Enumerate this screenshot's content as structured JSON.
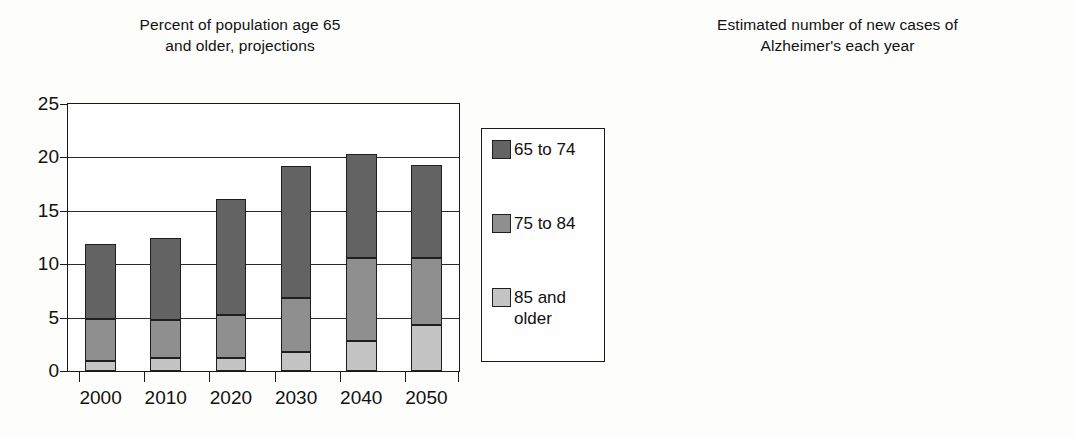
{
  "figure": {
    "background": "#fdfdfb",
    "axis_color": "#1a1a1a"
  },
  "legend": {
    "name": "age-group-legend",
    "position": "center",
    "entries": [
      {
        "label": "65 to 74",
        "color": "#636363"
      },
      {
        "label": "75 to 84",
        "color": "#8f8f8f"
      },
      {
        "label": "85 and\nolder",
        "color": "#c4c4c4"
      }
    ]
  },
  "chart_data": [
    {
      "id": "population-65-plus",
      "type": "bar",
      "stacked": true,
      "title": "Percent of population age 65\nand older, projections",
      "xlabel": "",
      "ylabel": "",
      "categories": [
        "2000",
        "2010",
        "2020",
        "2030",
        "2040",
        "2050"
      ],
      "ylim": [
        0,
        25
      ],
      "yticks": [
        0,
        5,
        10,
        15,
        20,
        25
      ],
      "ytick_labels": [
        "0",
        "5",
        "10",
        "15",
        "20",
        "25"
      ],
      "grid": true,
      "series": [
        {
          "name": "85 and older",
          "color": "#c4c4c4",
          "values": [
            0.9,
            1.2,
            1.2,
            1.8,
            2.8,
            4.3
          ]
        },
        {
          "name": "75 to 84",
          "color": "#8f8f8f",
          "values": [
            4.0,
            3.6,
            4.0,
            5.0,
            7.8,
            6.3
          ]
        },
        {
          "name": "65 to 74",
          "color": "#636363",
          "values": [
            7.0,
            7.7,
            10.9,
            12.4,
            9.7,
            8.7
          ]
        }
      ],
      "totals": [
        11.9,
        12.5,
        16.1,
        19.2,
        20.3,
        19.3
      ]
    },
    {
      "id": "new-alzheimers-cases",
      "type": "bar",
      "stacked": true,
      "title": "Estimated number of new cases of\nAlzheimer's each year",
      "xlabel": "",
      "ylabel": "",
      "categories": [
        "2000",
        "2010",
        "2020",
        "2030",
        "2040",
        "2050"
      ],
      "ylim": [
        0,
        1
      ],
      "yticks": [
        0,
        0.2,
        0.4,
        0.6,
        0.8,
        1
      ],
      "ytick_labels": [
        "0",
        "0.2",
        "0.4",
        "0.6",
        "0.8",
        "1"
      ],
      "grid": true,
      "series": [
        {
          "name": "85 and older",
          "color": "#c4c4c4",
          "values": [
            0.175,
            0.22,
            0.24,
            0.3,
            0.39,
            0.59
          ]
        },
        {
          "name": "75 to 84",
          "color": "#8f8f8f",
          "values": [
            0.18,
            0.19,
            0.18,
            0.21,
            0.335,
            0.25
          ]
        },
        {
          "name": "65 to 74",
          "color": "#636363",
          "values": [
            0.05,
            0.04,
            0.06,
            0.07,
            0.065,
            0.08
          ]
        }
      ],
      "totals": [
        0.405,
        0.45,
        0.48,
        0.58,
        0.79,
        0.92
      ]
    }
  ]
}
